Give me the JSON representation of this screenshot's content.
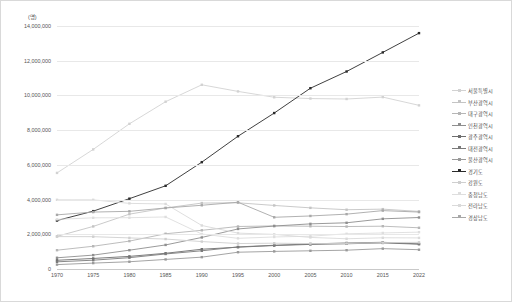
{
  "chart_data": {
    "type": "line",
    "title": "",
    "subtitle": "",
    "unit_label": "(명)",
    "xlabel": "",
    "ylabel": "",
    "grid": true,
    "legend_position": "right",
    "ylim": [
      0,
      14000000
    ],
    "ytick_labels": [
      "0",
      "2,000,000",
      "4,000,000",
      "6,000,000",
      "8,000,000",
      "10,000,000",
      "12,000,000",
      "14,000,000"
    ],
    "ytick_values": [
      0,
      2000000,
      4000000,
      6000000,
      8000000,
      10000000,
      12000000,
      14000000
    ],
    "categories": [
      "1970",
      "1975",
      "1980",
      "1985",
      "1990",
      "1995",
      "2000",
      "2005",
      "2010",
      "2015",
      "2022"
    ],
    "x": [
      1970,
      1975,
      1980,
      1985,
      1990,
      1995,
      2000,
      2005,
      2010,
      2015,
      2022
    ],
    "series": [
      {
        "name": "서울특별시",
        "color": "#d2d2d2",
        "values": [
          5536000,
          6890000,
          8364000,
          9639000,
          10613000,
          10231000,
          9895000,
          9820000,
          9794000,
          9904000,
          9428000
        ]
      },
      {
        "name": "부산광역시",
        "color": "#c4c4c4",
        "values": [
          1881000,
          2453000,
          3160000,
          3515000,
          3798000,
          3814000,
          3662000,
          3523000,
          3415000,
          3449000,
          3318000
        ]
      },
      {
        "name": "대구광역시",
        "color": "#b6b6b6",
        "values": [
          1083000,
          1311000,
          1607000,
          2030000,
          2229000,
          2449000,
          2481000,
          2464000,
          2446000,
          2466000,
          2374000
        ]
      },
      {
        "name": "인천광역시",
        "color": "#8f8f8f",
        "values": [
          646000,
          800000,
          1084000,
          1387000,
          1818000,
          2308000,
          2475000,
          2600000,
          2662000,
          2890000,
          2967000
        ]
      },
      {
        "name": "광주광역시",
        "color": "#6e6e6e",
        "values": [
          503000,
          607000,
          727000,
          906000,
          1139000,
          1257000,
          1352000,
          1417000,
          1454000,
          1502000,
          1430000
        ]
      },
      {
        "name": "대전광역시",
        "color": "#7a7a7a",
        "values": [
          414000,
          507000,
          652000,
          866000,
          1050000,
          1272000,
          1368000,
          1442000,
          1501000,
          1538000,
          1446000
        ]
      },
      {
        "name": "울산광역시",
        "color": "#9a9a9a",
        "values": [
          253000,
          340000,
          418000,
          551000,
          683000,
          967000,
          1014000,
          1049000,
          1083000,
          1173000,
          1111000
        ]
      },
      {
        "name": "경기도",
        "color": "#2a2a2a",
        "values": [
          2792000,
          3333000,
          4051000,
          4793000,
          6155000,
          7649000,
          8984000,
          10415000,
          11379000,
          12479000,
          13589000
        ]
      },
      {
        "name": "강원도",
        "color": "#cfcfcf",
        "values": [
          1867000,
          1862000,
          1791000,
          1725000,
          1580000,
          1466000,
          1487000,
          1464000,
          1471000,
          1518000,
          1536000
        ]
      },
      {
        "name": "충청남도",
        "color": "#dedede",
        "values": [
          2860000,
          2949000,
          2956000,
          2999000,
          2014000,
          1767000,
          1845000,
          1889000,
          2028000,
          2077000,
          2123000
        ]
      },
      {
        "name": "전라남도",
        "color": "#dadada",
        "values": [
          3987000,
          3985000,
          3780000,
          3748000,
          2507000,
          2067000,
          1995000,
          1820000,
          1741000,
          1799000,
          1792000
        ]
      },
      {
        "name": "경상남도",
        "color": "#a8a8a8",
        "values": [
          3120000,
          3280000,
          3322000,
          3516000,
          3672000,
          3846000,
          2979000,
          3056000,
          3160000,
          3364000,
          3280000
        ]
      }
    ]
  },
  "axis": {
    "y_unit": "(명)",
    "y_ticks": [
      "14,000,000",
      "12,000,000",
      "10,000,000",
      "8,000,000",
      "6,000,000",
      "4,000,000",
      "2,000,000",
      "0"
    ],
    "x_ticks": [
      "1970",
      "1975",
      "1980",
      "1985",
      "1990",
      "1995",
      "2000",
      "2005",
      "2010",
      "2015",
      "2022"
    ]
  },
  "legend": {
    "items": [
      {
        "label": "서울특별시",
        "color": "#d2d2d2"
      },
      {
        "label": "부산광역시",
        "color": "#c4c4c4"
      },
      {
        "label": "대구광역시",
        "color": "#b6b6b6"
      },
      {
        "label": "인천광역시",
        "color": "#8f8f8f"
      },
      {
        "label": "광주광역시",
        "color": "#6e6e6e"
      },
      {
        "label": "대전광역시",
        "color": "#7a7a7a"
      },
      {
        "label": "울산광역시",
        "color": "#9a9a9a"
      },
      {
        "label": "경기도",
        "color": "#2a2a2a"
      },
      {
        "label": "강원도",
        "color": "#cfcfcf"
      },
      {
        "label": "충청남도",
        "color": "#dedede"
      },
      {
        "label": "전라남도",
        "color": "#dadada"
      },
      {
        "label": "경상남도",
        "color": "#a8a8a8"
      }
    ]
  },
  "caption": {
    "text": ""
  }
}
